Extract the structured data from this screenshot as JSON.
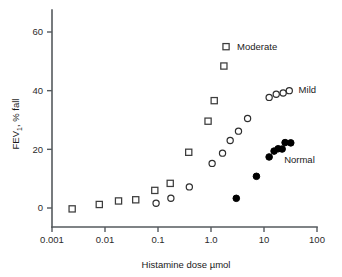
{
  "chart_data": {
    "type": "scatter",
    "title": "",
    "xlabel": "Histamine dose µmol",
    "ylabel": "FEV₁, % fall",
    "ylabel_main": "FEV",
    "ylabel_sub": "1",
    "ylabel_tail": ", % fall",
    "xscale": "log",
    "yscale": "linear",
    "xlim": [
      0.001,
      100
    ],
    "ylim": [
      -5,
      65
    ],
    "grid": false,
    "legend": "inline-annotations",
    "xticks": [
      0.001,
      0.01,
      0.1,
      1.0,
      10,
      100
    ],
    "xtick_labels": [
      "0.001",
      "0.01",
      "0.1",
      "1.0",
      "10",
      "100"
    ],
    "yticks": [
      0,
      20,
      40,
      60
    ],
    "ytick_labels": [
      "0",
      "20",
      "40",
      "60"
    ],
    "annotations": [
      {
        "text": "Moderate",
        "x": 3.1,
        "y": 55.0,
        "marker": "open-square"
      },
      {
        "text": "Mild",
        "x": 45.0,
        "y": 40.5,
        "marker": "none"
      },
      {
        "text": "Normal",
        "x": 24.0,
        "y": 16.5,
        "marker": "none"
      }
    ],
    "series": [
      {
        "name": "Moderate",
        "marker": "open-square",
        "points": [
          {
            "x": 0.0024,
            "y": -0.3
          },
          {
            "x": 0.0078,
            "y": 1.2
          },
          {
            "x": 0.018,
            "y": 2.4
          },
          {
            "x": 0.038,
            "y": 2.8
          },
          {
            "x": 0.087,
            "y": 6.0
          },
          {
            "x": 0.17,
            "y": 8.4
          },
          {
            "x": 0.38,
            "y": 19.0
          },
          {
            "x": 0.88,
            "y": 29.6
          },
          {
            "x": 1.15,
            "y": 36.6
          },
          {
            "x": 1.75,
            "y": 48.4
          }
        ]
      },
      {
        "name": "Mild",
        "marker": "open-circle",
        "points": [
          {
            "x": 0.092,
            "y": 1.6
          },
          {
            "x": 0.175,
            "y": 3.3
          },
          {
            "x": 0.39,
            "y": 7.2
          },
          {
            "x": 1.05,
            "y": 15.2
          },
          {
            "x": 1.65,
            "y": 18.7
          },
          {
            "x": 2.3,
            "y": 23.0
          },
          {
            "x": 3.3,
            "y": 26.2
          },
          {
            "x": 4.9,
            "y": 30.5
          },
          {
            "x": 12.5,
            "y": 37.7
          },
          {
            "x": 17.0,
            "y": 38.8
          },
          {
            "x": 23.0,
            "y": 39.2
          },
          {
            "x": 30.0,
            "y": 40.0
          }
        ]
      },
      {
        "name": "Normal",
        "marker": "filled-circle",
        "points": [
          {
            "x": 3.0,
            "y": 3.3
          },
          {
            "x": 7.2,
            "y": 10.8
          },
          {
            "x": 12.5,
            "y": 17.4
          },
          {
            "x": 15.5,
            "y": 19.4
          },
          {
            "x": 18.5,
            "y": 20.2
          },
          {
            "x": 22.0,
            "y": 20.1
          },
          {
            "x": 25.0,
            "y": 22.3
          },
          {
            "x": 32.0,
            "y": 22.2
          }
        ]
      }
    ],
    "colors": {
      "axis": "#555a5e",
      "text": "#1a1a1a",
      "open_marker_stroke": "#2e2e2e",
      "filled_marker": "#000000",
      "background": "#ffffff"
    }
  }
}
